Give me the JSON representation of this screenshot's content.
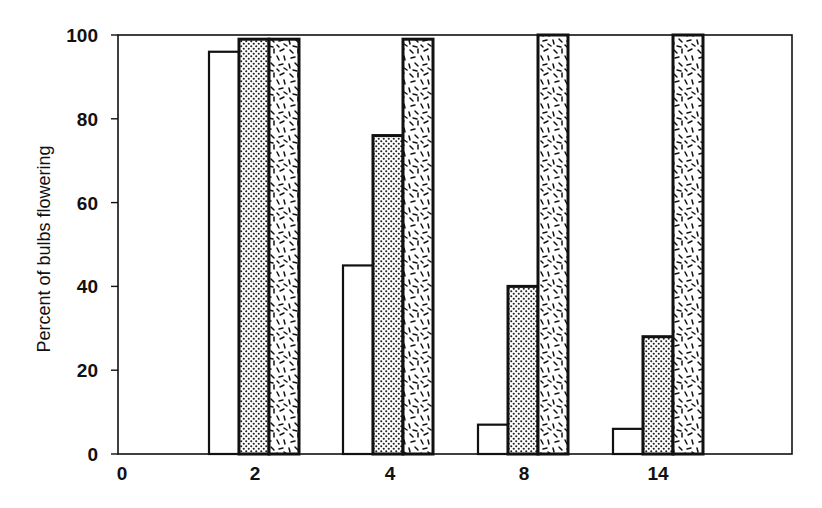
{
  "chart_data": {
    "type": "bar",
    "title": "",
    "xlabel": "",
    "ylabel": "Percent of bubs flowering",
    "categories": [
      "2",
      "4",
      "8",
      "14"
    ],
    "x_origin_label": "0",
    "series": [
      {
        "name": "Series 1 (open/white)",
        "pattern": "none",
        "values": [
          96,
          45,
          7,
          6
        ]
      },
      {
        "name": "Series 2 (fine dots)",
        "pattern": "dots",
        "values": [
          99,
          76,
          40,
          28
        ]
      },
      {
        "name": "Series 3 (random dashes)",
        "pattern": "dashes",
        "values": [
          99,
          99,
          100,
          100
        ]
      }
    ],
    "ylim": [
      0,
      100
    ],
    "yticks": [
      0,
      20,
      40,
      60,
      80,
      100
    ],
    "grid": false,
    "legend": "none"
  },
  "axes": {
    "ylabel": "Percent of bulbs flowering",
    "yticks": [
      "0",
      "20",
      "40",
      "60",
      "80",
      "100"
    ],
    "xticks": [
      "0",
      "2",
      "4",
      "8",
      "14"
    ]
  },
  "colors": {
    "ink": "#111111",
    "background": "#ffffff",
    "dot_fill": "#d8d8d8"
  }
}
